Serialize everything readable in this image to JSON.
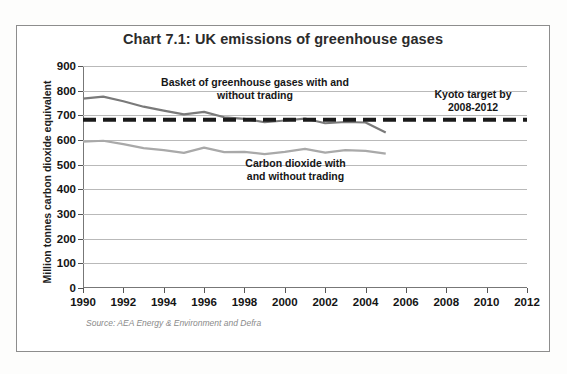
{
  "figure": {
    "title": "Chart 7.1: UK emissions of greenhouse gases",
    "source_note": "Source: AEA Energy & Environment and Defra",
    "annotations": {
      "basket": "Basket of greenhouse gases with and\nwithout trading",
      "kyoto": "Kyoto target by\n2008-2012",
      "co2": "Carbon dioxide with\nand without trading"
    }
  },
  "chart_data": {
    "type": "line",
    "title": "Chart 7.1: UK emissions of greenhouse gases",
    "xlabel": "",
    "ylabel": "Million tonnes carbon dioxide equivalent",
    "xlim": [
      1990,
      2012
    ],
    "ylim": [
      0,
      900
    ],
    "yticks": [
      0,
      100,
      200,
      300,
      400,
      500,
      600,
      700,
      800,
      900
    ],
    "xticks": [
      1990,
      1992,
      1994,
      1996,
      1998,
      2000,
      2002,
      2004,
      2006,
      2008,
      2010,
      2012
    ],
    "grid": true,
    "legend": "none (inline annotations)",
    "series": [
      {
        "name": "Basket of greenhouse gases with and without trading",
        "color": "#7a7a7a",
        "x": [
          1990,
          1991,
          1992,
          1993,
          1994,
          1995,
          1996,
          1997,
          1998,
          1999,
          2000,
          2001,
          2002,
          2003,
          2004,
          2005
        ],
        "values": [
          768,
          776,
          757,
          735,
          719,
          704,
          714,
          692,
          686,
          672,
          679,
          687,
          668,
          673,
          671,
          630
        ]
      },
      {
        "name": "Carbon dioxide with and without trading",
        "color": "#a9a9a9",
        "x": [
          1990,
          1991,
          1992,
          1993,
          1994,
          1995,
          1996,
          1997,
          1998,
          1999,
          2000,
          2001,
          2002,
          2003,
          2004,
          2005
        ],
        "values": [
          593,
          597,
          583,
          567,
          559,
          548,
          569,
          551,
          552,
          543,
          552,
          564,
          549,
          559,
          556,
          545
        ]
      },
      {
        "name": "Kyoto target by 2008-2012",
        "color": "#1a1a1a",
        "style": "dashed",
        "x": [
          1990,
          2012
        ],
        "values": [
          682,
          682
        ]
      }
    ]
  },
  "axis": {
    "y_tick_labels": [
      "900",
      "800",
      "700",
      "600",
      "500",
      "400",
      "300",
      "200",
      "100",
      "0"
    ],
    "x_tick_labels": [
      "1990",
      "1992",
      "1994",
      "1996",
      "1998",
      "2000",
      "2002",
      "2004",
      "2006",
      "2008",
      "2010",
      "2012"
    ]
  }
}
